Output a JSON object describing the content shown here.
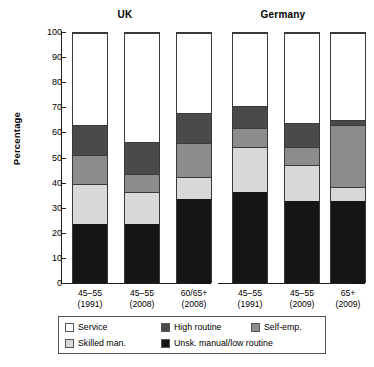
{
  "chart_data": {
    "type": "bar",
    "subtype": "stacked-bar",
    "title": "",
    "xlabel": "",
    "ylabel": "Percentage",
    "ylim": [
      0,
      100
    ],
    "yticks": [
      0,
      10,
      20,
      30,
      40,
      50,
      60,
      70,
      80,
      90,
      100
    ],
    "grid": false,
    "legend_position": "bottom",
    "stack_order_bottom_to_top": [
      "Unsk. manual/low routine",
      "Skilled man.",
      "Self-emp.",
      "High routine",
      "Service"
    ],
    "groups": [
      {
        "name": "UK",
        "categories": [
          "45–55\n(1991)",
          "45–55\n(2008)",
          "60/65+\n(2008)"
        ]
      },
      {
        "name": "Germany",
        "categories": [
          "45–55\n(1991)",
          "45–55\n(2009)",
          "65+\n(2009)"
        ]
      }
    ],
    "categories": [
      "45–55 (1991)",
      "45–55 (2008)",
      "60/65+ (2008)",
      "45–55 (1991)",
      "45–55 (2009)",
      "65+ (2009)"
    ],
    "series": [
      {
        "name": "Unsk. manual/low routine",
        "color": "#151515",
        "values": [
          24.0,
          24.0,
          34.0,
          36.5,
          33.0,
          33.0
        ]
      },
      {
        "name": "Skilled man.",
        "color": "#d8d8d8",
        "values": [
          16.0,
          12.5,
          8.5,
          18.0,
          14.5,
          5.5
        ]
      },
      {
        "name": "Self-emp.",
        "color": "#8c8c8c",
        "values": [
          11.5,
          7.5,
          13.5,
          7.5,
          7.0,
          25.0
        ]
      },
      {
        "name": "High routine",
        "color": "#4a4a4a",
        "values": [
          12.0,
          12.5,
          12.0,
          9.0,
          9.5,
          2.0
        ]
      },
      {
        "name": "Service",
        "color": "#ffffff",
        "values": [
          36.5,
          43.5,
          32.0,
          29.0,
          36.0,
          34.5
        ]
      }
    ],
    "cumulative_tops": [
      [
        24.0,
        40.0,
        51.5,
        63.5,
        100.0
      ],
      [
        24.0,
        36.5,
        44.0,
        56.5,
        100.0
      ],
      [
        34.0,
        42.5,
        56.0,
        68.0,
        100.0
      ],
      [
        36.5,
        54.5,
        62.0,
        71.0,
        100.0
      ],
      [
        33.0,
        47.5,
        54.5,
        64.0,
        100.0
      ],
      [
        33.0,
        38.5,
        63.5,
        65.5,
        100.0
      ]
    ]
  },
  "axis": {
    "ylabel": "Percentage",
    "ytick_labels": [
      "100",
      "90",
      "80",
      "70",
      "60",
      "50",
      "40",
      "30",
      "20",
      "10",
      "0"
    ]
  },
  "group_titles": {
    "uk": "UK",
    "germany": "Germany"
  },
  "xlabels": [
    {
      "line1": "45–55",
      "line2": "(1991)"
    },
    {
      "line1": "45–55",
      "line2": "(2008)"
    },
    {
      "line1": "60/65+",
      "line2": "(2008)"
    },
    {
      "line1": "45–55",
      "line2": "(1991)"
    },
    {
      "line1": "45–55",
      "line2": "(2009)"
    },
    {
      "line1": "65+",
      "line2": "(2009)"
    }
  ],
  "legend": {
    "rows": [
      [
        {
          "label": "Service",
          "color": "#ffffff"
        },
        {
          "label": "High routine",
          "color": "#4a4a4a"
        },
        {
          "label": "Self-emp.",
          "color": "#8c8c8c"
        }
      ],
      [
        {
          "label": "Skilled man.",
          "color": "#d8d8d8"
        },
        {
          "label": "Unsk. manual/low routine",
          "color": "#151515"
        }
      ]
    ]
  },
  "colors": {
    "service": "#ffffff",
    "high_routine": "#4a4a4a",
    "self_emp": "#8c8c8c",
    "skilled_man": "#d8d8d8",
    "unsk_manual": "#151515",
    "axis": "#222222",
    "bar_outline": "#3a3a3a"
  }
}
